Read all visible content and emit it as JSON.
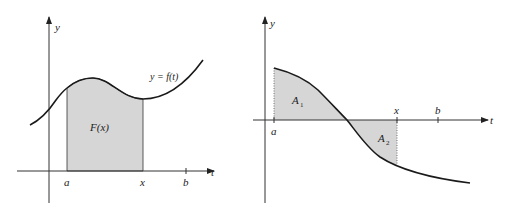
{
  "left_plot": {
    "y_axis_label": "y",
    "x_axis_label": "t",
    "curve_label": "y = f(t)",
    "area_label": "F(x)",
    "ticks": {
      "a": "a",
      "x": "x",
      "b": "b"
    }
  },
  "right_plot": {
    "y_axis_label": "y",
    "x_axis_label": "t",
    "area1_label": "A",
    "area1_sub": "1",
    "area2_label": "A",
    "area2_sub": "2",
    "ticks": {
      "a": "a",
      "x": "x",
      "b": "b"
    }
  },
  "colors": {
    "shade": "#d6d6d6",
    "stroke": "#1a1a1a",
    "axis": "#333333"
  }
}
